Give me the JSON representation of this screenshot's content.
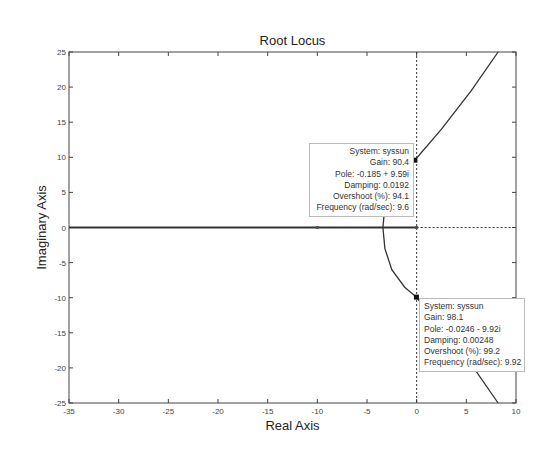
{
  "chart_data": {
    "type": "line",
    "title": "Root Locus",
    "xlabel": "Real Axis",
    "ylabel": "Imaginary Axis",
    "xlim": [
      -35,
      10
    ],
    "ylim": [
      -25,
      25
    ],
    "xticks": [
      -35,
      -30,
      -25,
      -20,
      -15,
      -10,
      -5,
      0,
      5,
      10
    ],
    "yticks": [
      25,
      20,
      15,
      10,
      5,
      0,
      -5,
      -10,
      -15,
      -20,
      -25
    ],
    "grid": false,
    "legend": null,
    "series": [
      {
        "name": "real-axis-branch",
        "x": [
          -35,
          0
        ],
        "y": [
          0,
          0
        ]
      },
      {
        "name": "upper-branch",
        "x": [
          -3.4,
          -3.2,
          -2.5,
          -1.5,
          -0.185,
          2.5,
          5.5,
          8.2
        ],
        "y": [
          0,
          3,
          6,
          8,
          9.59,
          14,
          19.5,
          25
        ]
      },
      {
        "name": "lower-branch",
        "x": [
          -3.4,
          -3.2,
          -2.5,
          -1.2,
          -0.0246,
          2.5,
          5.5,
          8.2
        ],
        "y": [
          0,
          -3,
          -6,
          -8.5,
          -9.92,
          -14.5,
          -19.5,
          -25
        ]
      }
    ],
    "markers": [
      {
        "x": -10,
        "y": 0,
        "shape": "small-marker"
      },
      {
        "x": 0,
        "y": 0,
        "shape": "small-marker"
      }
    ],
    "datatips": [
      {
        "x": -0.185,
        "y": 9.59,
        "lines": [
          "System: syssun",
          "Gain: 90.4",
          "Pole: -0.185 + 9.59i",
          "Damping: 0.0192",
          "Overshoot (%): 94.1",
          "Frequency (rad/sec): 9.6"
        ]
      },
      {
        "x": -0.0246,
        "y": -9.92,
        "lines": [
          "System: syssun",
          "Gain: 98.1",
          "Pole: -0.0246 - 9.92i",
          "Damping: 0.00248",
          "Overshoot (%): 99.2",
          "Frequency (rad/sec): 9.92"
        ]
      }
    ],
    "reference_lines": [
      {
        "orientation": "vertical",
        "x": 0,
        "style": "dotted"
      },
      {
        "orientation": "horizontal",
        "y": 0,
        "from_x": 0,
        "to_x": 10,
        "style": "dotted"
      }
    ]
  },
  "tips": {
    "upper": {
      "l0": "System: syssun",
      "l1": "Gain: 90.4",
      "l2": "Pole: -0.185 + 9.59i",
      "l3": "Damping: 0.0192",
      "l4": "Overshoot (%): 94.1",
      "l5": "Frequency (rad/sec): 9.6"
    },
    "lower": {
      "l0": "System: syssun",
      "l1": "Gain: 98.1",
      "l2": "Pole: -0.0246 - 9.92i",
      "l3": "Damping: 0.00248",
      "l4": "Overshoot (%): 99.2",
      "l5": "Frequency (rad/sec): 9.92"
    }
  }
}
